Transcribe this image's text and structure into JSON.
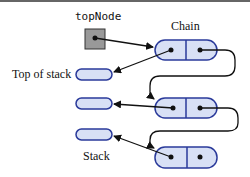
{
  "diagram": {
    "top_node_label": "topNode",
    "chain_label": "Chain",
    "top_of_stack_label": "Top of stack",
    "stack_label": "Stack",
    "colors": {
      "node_fill": "#d8e0f5",
      "node_stroke": "#2a3a9a",
      "pointer_box": "#999999"
    },
    "chain_nodes": 3,
    "stack_entries": 3
  }
}
